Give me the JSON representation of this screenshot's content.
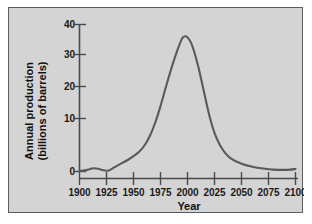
{
  "figure": {
    "background_color": "#d4d4d4",
    "border_color": "#5c5c5c",
    "page_background": "#ffffff"
  },
  "chart_data": {
    "type": "line",
    "title": "",
    "xlabel": "Year",
    "ylabel": "Annual production (billions of barrels)",
    "ylabel_line1": "Annual production",
    "ylabel_line2": "(billions of barrels)",
    "xlim": [
      1900,
      2100
    ],
    "ylim": [
      0,
      40
    ],
    "xticks": [
      1900,
      1925,
      1950,
      1975,
      2000,
      2025,
      2050,
      2075,
      2100
    ],
    "xtick_labels": [
      "1900",
      "1925",
      "1950",
      "1975",
      "2000",
      "2025",
      "2050",
      "2075",
      "2100"
    ],
    "yticks": [
      0,
      10,
      20,
      30,
      40
    ],
    "ytick_labels": [
      "0",
      "10",
      "20",
      "30",
      "40"
    ],
    "grid": false,
    "legend": null,
    "line_color": "#5a5a5a",
    "line_width": 2.1,
    "series": [
      {
        "name": "Annual oil production",
        "x": [
          1900,
          1905,
          1910,
          1913,
          1916,
          1920,
          1925,
          1928,
          1931,
          1935,
          1940,
          1945,
          1950,
          1955,
          1960,
          1965,
          1970,
          1975,
          1980,
          1985,
          1990,
          1995,
          1998,
          2000,
          2003,
          2006,
          2010,
          2015,
          2020,
          2025,
          2030,
          2035,
          2040,
          2050,
          2060,
          2070,
          2080,
          2090,
          2095,
          2100
        ],
        "y": [
          0.2,
          0.3,
          0.7,
          0.9,
          0.8,
          0.5,
          0.2,
          0.4,
          0.9,
          1.6,
          2.4,
          3.2,
          4.2,
          5.3,
          7.0,
          9.6,
          13.2,
          17.8,
          23.0,
          28.0,
          32.5,
          36.2,
          36.8,
          36.5,
          35.2,
          32.8,
          28.5,
          22.0,
          15.5,
          10.5,
          7.2,
          5.0,
          3.6,
          2.1,
          1.3,
          0.8,
          0.5,
          0.45,
          0.5,
          0.7
        ]
      }
    ],
    "annotations": []
  }
}
